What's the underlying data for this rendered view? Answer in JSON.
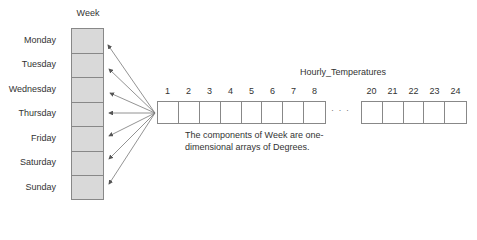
{
  "week": {
    "title": "Week",
    "days": [
      "Monday",
      "Tuesday",
      "Wednesday",
      "Thursday",
      "Friday",
      "Saturday",
      "Sunday"
    ]
  },
  "hourly_temperatures": {
    "title": "Hourly_Temperatures",
    "first_indices": [
      "1",
      "2",
      "3",
      "4",
      "5",
      "6",
      "7",
      "8"
    ],
    "last_indices": [
      "20",
      "21",
      "22",
      "23",
      "24"
    ],
    "ellipsis": "· · ·"
  },
  "caption": "The components of Week are one-dimensional arrays of Degrees.",
  "colors": {
    "week_cell_fill": "#d9d9d9",
    "border": "#888888",
    "arrow": "#555555"
  }
}
